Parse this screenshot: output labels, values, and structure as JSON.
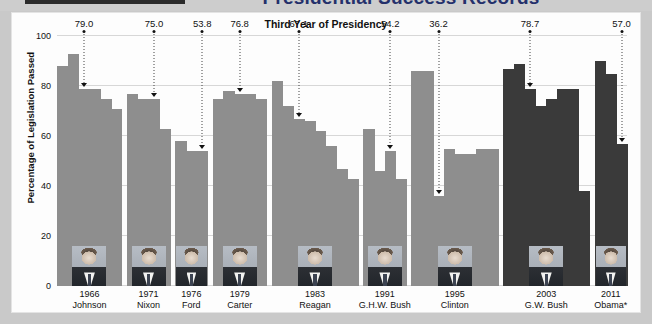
{
  "title": {
    "main": "Presidential Success Records",
    "chart_header": "Third Year of Presidency"
  },
  "axis": {
    "y_label": "Percentage of Legislation Passed",
    "y_ticks": [
      "0",
      "20",
      "40",
      "60",
      "80",
      "100"
    ]
  },
  "chart_data": {
    "type": "bar",
    "title": "Presidential Success Records",
    "subtitle": "Third Year of Presidency",
    "xlabel": "",
    "ylabel": "Percentage of Legislation Passed",
    "ylim": [
      0,
      100
    ],
    "yticks": [
      0,
      20,
      40,
      60,
      80,
      100
    ],
    "grid": true,
    "legend": "none",
    "categories": [
      "1966 Johnson",
      "1971 Nixon",
      "1976 Ford",
      "1979 Carter",
      "1983 Reagan",
      "1991 G.H.W. Bush",
      "1995 Clinton",
      "2003 G.W. Bush",
      "2011 Obama*"
    ],
    "highlighted_values": [
      79.0,
      75.0,
      53.8,
      76.8,
      67.1,
      54.2,
      36.2,
      78.7,
      57.0
    ],
    "groups": [
      {
        "president": "Johnson",
        "year": "1966",
        "third_year_value": 79.0,
        "bars": [
          88,
          93,
          79,
          79,
          75,
          71
        ]
      },
      {
        "president": "Nixon",
        "year": "1971",
        "third_year_value": 75.0,
        "bars": [
          77,
          75,
          75,
          63
        ]
      },
      {
        "president": "Ford",
        "year": "1976",
        "third_year_value": 53.8,
        "bars": [
          58,
          54,
          54
        ]
      },
      {
        "president": "Carter",
        "year": "1979",
        "third_year_value": 76.8,
        "bars": [
          75,
          78,
          77,
          77,
          75
        ]
      },
      {
        "president": "Reagan",
        "year": "1983",
        "third_year_value": 67.1,
        "bars": [
          82,
          72,
          67,
          66,
          62,
          56,
          47,
          43
        ]
      },
      {
        "president": "G.H.W. Bush",
        "year": "1991",
        "third_year_value": 54.2,
        "bars": [
          63,
          46,
          54,
          43
        ]
      },
      {
        "president": "Clinton",
        "year": "1995",
        "third_year_value": 36.2,
        "bars": [
          86,
          86,
          36,
          55,
          53,
          53,
          55,
          55
        ]
      },
      {
        "president": "G.W. Bush",
        "year": "2003",
        "third_year_value": 78.7,
        "bars": [
          87,
          89,
          79,
          72,
          75,
          79,
          79,
          38
        ]
      },
      {
        "president": "Obama*",
        "year": "2011",
        "third_year_value": 57.0,
        "bars": [
          90,
          85,
          57
        ]
      }
    ]
  },
  "colors": {
    "bar_light": "#8e8e8e",
    "bar_dark": "#3a3a3a",
    "grid": "#d7d7d7",
    "title_accent": "#24306b",
    "card_bg": "#fdfdfd",
    "page_bg": "#c9c9c9"
  }
}
